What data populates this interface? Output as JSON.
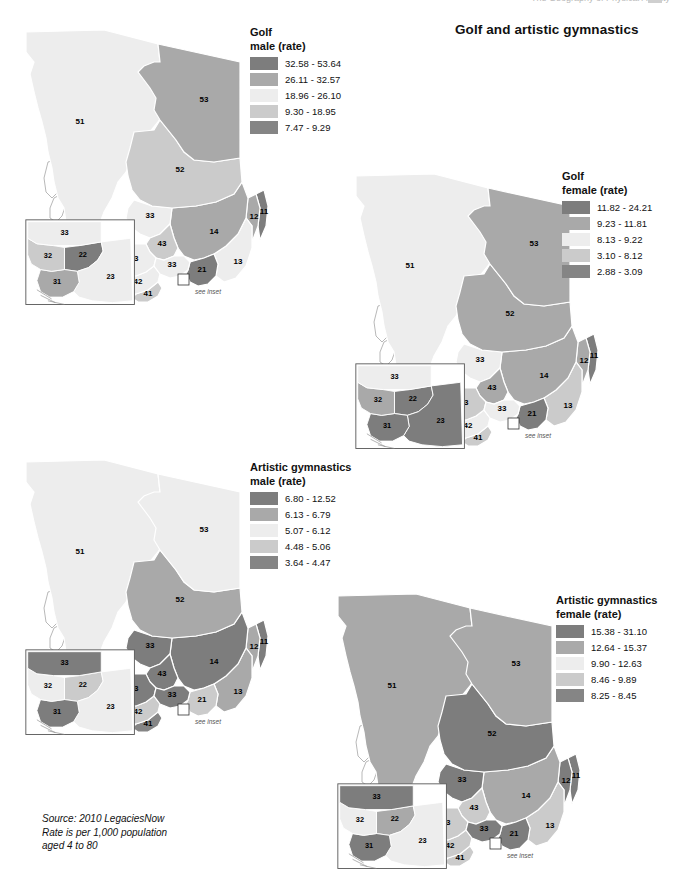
{
  "header": {
    "running_header": "The Geography of Physical Activity",
    "title": "Golf and artistic gymnastics"
  },
  "source_note": "Source: 2010 LegaciesNow\nRate is per 1,000 population\naged 4 to 80",
  "see_inset_label": "see inset",
  "palette": {
    "class1": "#7d7d7d",
    "class2": "#a9a9a9",
    "class3": "#ededed",
    "class4": "#cbcbcb",
    "class5": "#858585",
    "outline": "#ffffff",
    "inset_border": "#5a5a5a"
  },
  "maps": [
    {
      "id": "golf-male",
      "legend": {
        "title_line1": "Golf",
        "title_line2": "male (rate)",
        "classes": [
          {
            "label": "32.58 - 53.64",
            "color": "#7d7d7d"
          },
          {
            "label": "26.11 - 32.57",
            "color": "#a9a9a9"
          },
          {
            "label": "18.96 - 26.10",
            "color": "#ededed"
          },
          {
            "label": "9.30 - 18.95",
            "color": "#cbcbcb"
          },
          {
            "label": "7.47 - 9.29",
            "color": "#858585"
          }
        ]
      },
      "regions": {
        "51": {
          "label": "51",
          "color": "#ededed"
        },
        "53": {
          "label": "53",
          "color": "#a9a9a9"
        },
        "52": {
          "label": "52",
          "color": "#cbcbcb"
        },
        "33": {
          "label": "33",
          "color": "#ededed"
        },
        "14": {
          "label": "14",
          "color": "#a9a9a9"
        },
        "43a": {
          "label": "43",
          "color": "#cbcbcb"
        },
        "43b": {
          "label": "43",
          "color": "#ededed"
        },
        "33b": {
          "label": "33",
          "color": "#ededed"
        },
        "21": {
          "label": "21",
          "color": "#7d7d7d"
        },
        "13": {
          "label": "13",
          "color": "#ededed"
        },
        "12": {
          "label": "12",
          "color": "#a9a9a9"
        },
        "11": {
          "label": "11",
          "color": "#7d7d7d"
        },
        "42": {
          "label": "42",
          "color": "#ededed"
        },
        "41": {
          "label": "41",
          "color": "#cbcbcb"
        }
      },
      "inset": {
        "33": {
          "label": "33",
          "color": "#ededed"
        },
        "32": {
          "label": "32",
          "color": "#cbcbcb"
        },
        "22": {
          "label": "22",
          "color": "#7d7d7d"
        },
        "31": {
          "label": "31",
          "color": "#a9a9a9"
        },
        "23": {
          "label": "23",
          "color": "#ededed"
        }
      }
    },
    {
      "id": "golf-female",
      "legend": {
        "title_line1": "Golf",
        "title_line2": "female (rate)",
        "classes": [
          {
            "label": "11.82 - 24.21",
            "color": "#7d7d7d"
          },
          {
            "label": "9.23 - 11.81",
            "color": "#a9a9a9"
          },
          {
            "label": "8.13 - 9.22",
            "color": "#ededed"
          },
          {
            "label": "3.10 - 8.12",
            "color": "#cbcbcb"
          },
          {
            "label": "2.88 - 3.09",
            "color": "#858585"
          }
        ]
      },
      "regions": {
        "51": {
          "label": "51",
          "color": "#ededed"
        },
        "53": {
          "label": "53",
          "color": "#a9a9a9"
        },
        "52": {
          "label": "52",
          "color": "#a9a9a9"
        },
        "33": {
          "label": "33",
          "color": "#ededed"
        },
        "14": {
          "label": "14",
          "color": "#a9a9a9"
        },
        "43a": {
          "label": "43",
          "color": "#a9a9a9"
        },
        "43b": {
          "label": "43",
          "color": "#cbcbcb"
        },
        "33b": {
          "label": "33",
          "color": "#ededed"
        },
        "21": {
          "label": "21",
          "color": "#7d7d7d"
        },
        "13": {
          "label": "13",
          "color": "#cbcbcb"
        },
        "12": {
          "label": "12",
          "color": "#a9a9a9"
        },
        "11": {
          "label": "11",
          "color": "#7d7d7d"
        },
        "42": {
          "label": "42",
          "color": "#ededed"
        },
        "41": {
          "label": "41",
          "color": "#cbcbcb"
        }
      },
      "inset": {
        "33": {
          "label": "33",
          "color": "#ededed"
        },
        "32": {
          "label": "32",
          "color": "#a9a9a9"
        },
        "22": {
          "label": "22",
          "color": "#7d7d7d"
        },
        "31": {
          "label": "31",
          "color": "#7d7d7d"
        },
        "23": {
          "label": "23",
          "color": "#7d7d7d"
        }
      }
    },
    {
      "id": "artistic-gymnastics-male",
      "legend": {
        "title_line1": "Artistic gymnastics",
        "title_line2": "male (rate)",
        "classes": [
          {
            "label": "6.80 - 12.52",
            "color": "#7d7d7d"
          },
          {
            "label": "6.13 - 6.79",
            "color": "#a9a9a9"
          },
          {
            "label": "5.07 - 6.12",
            "color": "#ededed"
          },
          {
            "label": "4.48 - 5.06",
            "color": "#cbcbcb"
          },
          {
            "label": "3.64 - 4.47",
            "color": "#858585"
          }
        ]
      },
      "regions": {
        "51": {
          "label": "51",
          "color": "#ededed"
        },
        "53": {
          "label": "53",
          "color": "#ededed"
        },
        "52": {
          "label": "52",
          "color": "#a9a9a9"
        },
        "33": {
          "label": "33",
          "color": "#7d7d7d"
        },
        "14": {
          "label": "14",
          "color": "#7d7d7d"
        },
        "43a": {
          "label": "43",
          "color": "#7d7d7d"
        },
        "43b": {
          "label": "43",
          "color": "#7d7d7d"
        },
        "33b": {
          "label": "33",
          "color": "#7d7d7d"
        },
        "21": {
          "label": "21",
          "color": "#cbcbcb"
        },
        "13": {
          "label": "13",
          "color": "#a9a9a9"
        },
        "12": {
          "label": "12",
          "color": "#a9a9a9"
        },
        "11": {
          "label": "11",
          "color": "#7d7d7d"
        },
        "42": {
          "label": "42",
          "color": "#cbcbcb"
        },
        "41": {
          "label": "41",
          "color": "#858585"
        }
      },
      "inset": {
        "33": {
          "label": "33",
          "color": "#7d7d7d"
        },
        "32": {
          "label": "32",
          "color": "#ededed"
        },
        "22": {
          "label": "22",
          "color": "#cbcbcb"
        },
        "31": {
          "label": "31",
          "color": "#7d7d7d"
        },
        "23": {
          "label": "23",
          "color": "#ededed"
        }
      }
    },
    {
      "id": "artistic-gymnastics-female",
      "legend": {
        "title_line1": "Artistic gymnastics",
        "title_line2": "female (rate)",
        "classes": [
          {
            "label": "15.38 - 31.10",
            "color": "#7d7d7d"
          },
          {
            "label": "12.64 - 15.37",
            "color": "#a9a9a9"
          },
          {
            "label": "9.90 - 12.63",
            "color": "#ededed"
          },
          {
            "label": "8.46 - 9.89",
            "color": "#cbcbcb"
          },
          {
            "label": "8.25 - 8.45",
            "color": "#858585"
          }
        ]
      },
      "regions": {
        "51": {
          "label": "51",
          "color": "#a9a9a9"
        },
        "53": {
          "label": "53",
          "color": "#a9a9a9"
        },
        "52": {
          "label": "52",
          "color": "#7d7d7d"
        },
        "33": {
          "label": "33",
          "color": "#7d7d7d"
        },
        "14": {
          "label": "14",
          "color": "#a9a9a9"
        },
        "43a": {
          "label": "43",
          "color": "#cbcbcb"
        },
        "43b": {
          "label": "43",
          "color": "#cbcbcb"
        },
        "33b": {
          "label": "33",
          "color": "#7d7d7d"
        },
        "21": {
          "label": "21",
          "color": "#7d7d7d"
        },
        "13": {
          "label": "13",
          "color": "#cbcbcb"
        },
        "12": {
          "label": "12",
          "color": "#7d7d7d"
        },
        "11": {
          "label": "11",
          "color": "#7d7d7d"
        },
        "42": {
          "label": "42",
          "color": "#cbcbcb"
        },
        "41": {
          "label": "41",
          "color": "#cbcbcb"
        }
      },
      "inset": {
        "33": {
          "label": "33",
          "color": "#7d7d7d"
        },
        "32": {
          "label": "32",
          "color": "#ededed"
        },
        "22": {
          "label": "22",
          "color": "#a9a9a9"
        },
        "31": {
          "label": "31",
          "color": "#7d7d7d"
        },
        "23": {
          "label": "23",
          "color": "#ededed"
        }
      }
    }
  ]
}
